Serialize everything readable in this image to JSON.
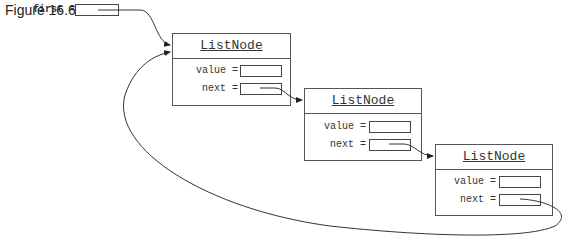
{
  "figure": {
    "title": "Figure 16.6"
  },
  "variable": {
    "label": "first ="
  },
  "nodes": [
    {
      "class_name": "ListNode",
      "value_label": "value =",
      "next_label": "next ="
    },
    {
      "class_name": "ListNode",
      "value_label": "value =",
      "next_label": "next ="
    },
    {
      "class_name": "ListNode",
      "value_label": "value =",
      "next_label": "next ="
    }
  ],
  "colors": {
    "line": "#333333",
    "box_border": "#555555",
    "background": "#ffffff"
  }
}
